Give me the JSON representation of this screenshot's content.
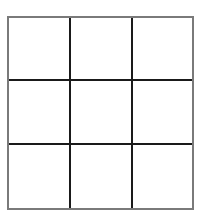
{
  "board": {
    "rows": 3,
    "cols": 3,
    "cells": [
      [
        "",
        "",
        ""
      ],
      [
        "",
        "",
        ""
      ],
      [
        "",
        "",
        ""
      ]
    ],
    "colors": {
      "outer_border": "#7a7a7a",
      "inner_lines": "#1a1a1a",
      "background": "#ffffff"
    }
  }
}
